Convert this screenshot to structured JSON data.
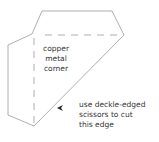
{
  "diagram": {
    "stroke_color": "#9a9a9a",
    "text_color": "#333333",
    "shape": {
      "outline_points": "42,11 112,11 124,35 34,126 8,115 8,45 32,34",
      "fold_lines": [
        {
          "x1": 45,
          "y1": 35,
          "x2": 116,
          "y2": 35
        },
        {
          "x1": 34,
          "y1": 38,
          "x2": 34,
          "y2": 125
        }
      ]
    },
    "center_label": {
      "lines": [
        "copper",
        "metal",
        "corner"
      ]
    },
    "note_label": {
      "lines": [
        "use deckle-edged",
        "scissors to cut",
        "this edge"
      ]
    },
    "arrow": {
      "direction": "left",
      "x": 58,
      "y": 108
    }
  }
}
